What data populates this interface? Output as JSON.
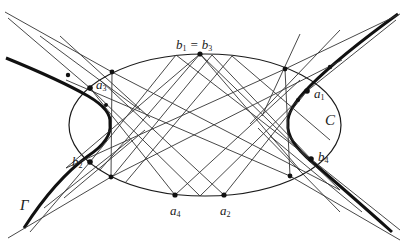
{
  "figure": {
    "labels": {
      "b_top": {
        "text": "b",
        "sub1": "1",
        "eq": " = ",
        "text2": "b",
        "sub2": "3"
      },
      "a1": {
        "text": "a",
        "sub": "1"
      },
      "a2": {
        "text": "a",
        "sub": "2"
      },
      "a3": {
        "text": "a",
        "sub": "3"
      },
      "a4": {
        "text": "a",
        "sub": "4"
      },
      "b2": {
        "text": "b",
        "sub": "2"
      },
      "b4": {
        "text": "b",
        "sub": "4"
      },
      "C": "C",
      "Gamma": "Γ"
    },
    "colors": {
      "stroke": "#1a1a1a",
      "thin": "#333333",
      "background": "#ffffff"
    },
    "ellipse": {
      "cx": 205,
      "cy": 125,
      "rx": 136,
      "ry": 71
    },
    "circle_C": {
      "note": "dual conic labeled C"
    },
    "points": {
      "b1_b3": [
        200,
        54
      ],
      "a1": [
        307,
        91
      ],
      "a2": [
        224,
        195
      ],
      "a3": [
        90,
        88
      ],
      "a4": [
        175,
        195
      ],
      "b2": [
        90,
        162
      ],
      "b4": [
        311,
        159
      ],
      "v_tl": [
        112,
        72
      ],
      "v_bl": [
        111,
        177
      ],
      "v_tr": [
        285,
        69
      ],
      "v_br": [
        290,
        176
      ]
    }
  }
}
